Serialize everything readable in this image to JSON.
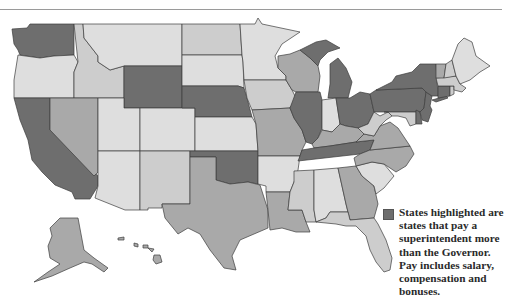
{
  "legend": {
    "swatch_color": "#6e6e6e",
    "text": "States highlighted are states that pay a superintendent more than the Governor. Pay includes salary, compensation and bonuses."
  },
  "palette": {
    "highlighted": "#6e6e6e",
    "medium": "#a9a9a9",
    "light": "#cdcdcd",
    "lightest": "#dedede",
    "border": "#3c3c3c",
    "rule": "#9a9a9a"
  },
  "highlighted_states": [
    "WA",
    "CA",
    "WY",
    "NE",
    "OK",
    "IL",
    "MI",
    "OH",
    "PA",
    "NY",
    "NJ",
    "CT",
    "TN",
    "DE"
  ],
  "states": [
    {
      "id": "WA",
      "name": "Washington",
      "shade": "highlighted"
    },
    {
      "id": "OR",
      "name": "Oregon",
      "shade": "lightest"
    },
    {
      "id": "CA",
      "name": "California",
      "shade": "highlighted"
    },
    {
      "id": "ID",
      "name": "Idaho",
      "shade": "light"
    },
    {
      "id": "NV",
      "name": "Nevada",
      "shade": "medium"
    },
    {
      "id": "MT",
      "name": "Montana",
      "shade": "lightest"
    },
    {
      "id": "WY",
      "name": "Wyoming",
      "shade": "highlighted"
    },
    {
      "id": "UT",
      "name": "Utah",
      "shade": "lightest"
    },
    {
      "id": "AZ",
      "name": "Arizona",
      "shade": "lightest"
    },
    {
      "id": "CO",
      "name": "Colorado",
      "shade": "lightest"
    },
    {
      "id": "NM",
      "name": "New Mexico",
      "shade": "light"
    },
    {
      "id": "ND",
      "name": "North Dakota",
      "shade": "light"
    },
    {
      "id": "SD",
      "name": "South Dakota",
      "shade": "lightest"
    },
    {
      "id": "NE",
      "name": "Nebraska",
      "shade": "highlighted"
    },
    {
      "id": "KS",
      "name": "Kansas",
      "shade": "lightest"
    },
    {
      "id": "OK",
      "name": "Oklahoma",
      "shade": "highlighted"
    },
    {
      "id": "TX",
      "name": "Texas",
      "shade": "medium"
    },
    {
      "id": "MN",
      "name": "Minnesota",
      "shade": "lightest"
    },
    {
      "id": "IA",
      "name": "Iowa",
      "shade": "light"
    },
    {
      "id": "MO",
      "name": "Missouri",
      "shade": "medium"
    },
    {
      "id": "AR",
      "name": "Arkansas",
      "shade": "lightest"
    },
    {
      "id": "LA",
      "name": "Louisiana",
      "shade": "medium"
    },
    {
      "id": "WI",
      "name": "Wisconsin",
      "shade": "medium"
    },
    {
      "id": "IL",
      "name": "Illinois",
      "shade": "highlighted"
    },
    {
      "id": "MI",
      "name": "Michigan",
      "shade": "highlighted"
    },
    {
      "id": "IN",
      "name": "Indiana",
      "shade": "lightest"
    },
    {
      "id": "OH",
      "name": "Ohio",
      "shade": "highlighted"
    },
    {
      "id": "KY",
      "name": "Kentucky",
      "shade": "medium"
    },
    {
      "id": "TN",
      "name": "Tennessee",
      "shade": "highlighted"
    },
    {
      "id": "MS",
      "name": "Mississippi",
      "shade": "light"
    },
    {
      "id": "AL",
      "name": "Alabama",
      "shade": "lightest"
    },
    {
      "id": "GA",
      "name": "Georgia",
      "shade": "medium"
    },
    {
      "id": "FL",
      "name": "Florida",
      "shade": "light"
    },
    {
      "id": "SC",
      "name": "South Carolina",
      "shade": "lightest"
    },
    {
      "id": "NC",
      "name": "North Carolina",
      "shade": "medium"
    },
    {
      "id": "VA",
      "name": "Virginia",
      "shade": "medium"
    },
    {
      "id": "WV",
      "name": "West Virginia",
      "shade": "light"
    },
    {
      "id": "PA",
      "name": "Pennsylvania",
      "shade": "highlighted"
    },
    {
      "id": "NY",
      "name": "New York",
      "shade": "highlighted"
    },
    {
      "id": "NJ",
      "name": "New Jersey",
      "shade": "highlighted"
    },
    {
      "id": "DE",
      "name": "Delaware",
      "shade": "highlighted"
    },
    {
      "id": "MD",
      "name": "Maryland",
      "shade": "light"
    },
    {
      "id": "CT",
      "name": "Connecticut",
      "shade": "highlighted"
    },
    {
      "id": "RI",
      "name": "Rhode Island",
      "shade": "light"
    },
    {
      "id": "MA",
      "name": "Massachusetts",
      "shade": "light"
    },
    {
      "id": "VT",
      "name": "Vermont",
      "shade": "medium"
    },
    {
      "id": "NH",
      "name": "New Hampshire",
      "shade": "light"
    },
    {
      "id": "ME",
      "name": "Maine",
      "shade": "lightest"
    },
    {
      "id": "AK",
      "name": "Alaska",
      "shade": "medium"
    },
    {
      "id": "HI",
      "name": "Hawaii",
      "shade": "medium"
    }
  ]
}
